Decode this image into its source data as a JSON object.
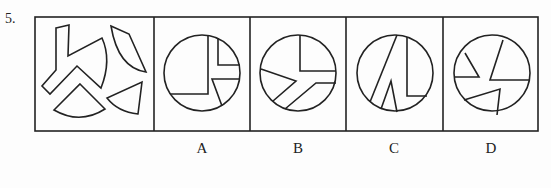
{
  "question": {
    "number": "5."
  },
  "options": [
    {
      "label": "A"
    },
    {
      "label": "B"
    },
    {
      "label": "C"
    },
    {
      "label": "D"
    }
  ],
  "colors": {
    "stroke": "#222222",
    "background": "#fdfdfd"
  }
}
